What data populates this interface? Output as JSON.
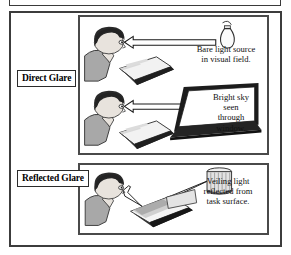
{
  "figure": {
    "background": "#ffffff",
    "frame_color": "#3c3c3c"
  },
  "tags": [
    {
      "id": "direct-glare",
      "label": "Direct Glare"
    },
    {
      "id": "reflected-glare",
      "label": "Reflected Glare"
    }
  ],
  "captions": {
    "bare": {
      "line1": "Bare light source",
      "line2": "in visual field."
    },
    "sky": {
      "line1": "Bright sky",
      "line2": "seen",
      "line3": "through",
      "line4": "window."
    },
    "veiling": {
      "line1": "Veiling light",
      "line2": "reflected from",
      "line3": "task surface."
    }
  },
  "panels": [
    {
      "id": "direct-glare-panel",
      "scenes": [
        {
          "id": "bare-bulb-scene",
          "light_source": "bare-light-bulb",
          "ray": "direct-ray-arrow"
        },
        {
          "id": "bright-window-scene",
          "light_source": "window-screen",
          "ray": "direct-ray-arrow"
        }
      ]
    },
    {
      "id": "reflected-glare-panel",
      "scenes": [
        {
          "id": "reflected-scene",
          "light_source": "cylindrical-lamp",
          "ray": "reflected-ray-arrow"
        }
      ]
    }
  ],
  "colors": {
    "ink": "#1a1a1a",
    "hair": "#2a2a2a",
    "skin": "#e8e3dd",
    "shirt": "#a8a8a8",
    "desk_top": "#e9e9e9",
    "desk_edge": "#2e2e2e",
    "ray_fill": "#ffffff",
    "window_dark": "#1c1c1c"
  }
}
